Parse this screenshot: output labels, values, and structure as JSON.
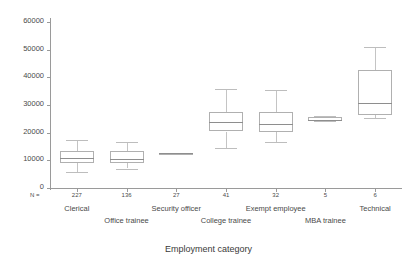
{
  "chart_data": {
    "type": "box",
    "title": "",
    "xlabel": "Employment category",
    "ylabel": "",
    "ylim": [
      0,
      62000
    ],
    "yticks": [
      0,
      10000,
      20000,
      30000,
      40000,
      50000,
      60000
    ],
    "ytick_labels": [
      "0",
      "10000",
      "20000",
      "30000",
      "40000",
      "50000",
      "60000"
    ],
    "grid": false,
    "n_prefix": "N =",
    "categories": [
      "Clerical",
      "Office trainee",
      "Security officer",
      "College trainee",
      "Exempt employee",
      "MBA trainee",
      "Technical"
    ],
    "counts": [
      227,
      136,
      27,
      41,
      32,
      5,
      6
    ],
    "boxes": [
      {
        "category": "Clerical",
        "whisker_low": 5800,
        "q1": 9000,
        "median": 10800,
        "q3": 13400,
        "whisker_high": 17300
      },
      {
        "category": "Office trainee",
        "whisker_low": 7000,
        "q1": 8900,
        "median": 10400,
        "q3": 13300,
        "whisker_high": 16800
      },
      {
        "category": "Security officer",
        "whisker_low": 12300,
        "q1": 12400,
        "median": 12500,
        "q3": 12700,
        "whisker_high": 12800
      },
      {
        "category": "College trainee",
        "whisker_low": 14500,
        "q1": 20300,
        "median": 23800,
        "q3": 27300,
        "whisker_high": 35800
      },
      {
        "category": "Exempt employee",
        "whisker_low": 16700,
        "q1": 20200,
        "median": 23000,
        "q3": 27600,
        "whisker_high": 35600
      },
      {
        "category": "MBA trainee",
        "whisker_low": 24200,
        "q1": 24300,
        "median": 24700,
        "q3": 25600,
        "whisker_high": 25900
      },
      {
        "category": "Technical",
        "whisker_low": 25300,
        "q1": 26400,
        "median": 30700,
        "q3": 42600,
        "whisker_high": 50900
      }
    ]
  },
  "colors": {
    "background": "#ffffff",
    "axis": "#9a9a9a",
    "box_border": "#b0b0b0",
    "whisker": "#c4c4c4",
    "text": "#4a4a4a"
  }
}
